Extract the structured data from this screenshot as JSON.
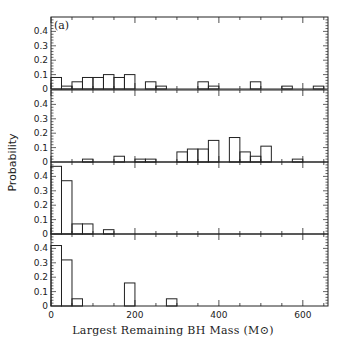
{
  "chart_data": {
    "type": "bar",
    "title": "",
    "panel_label": "(a)",
    "xlabel": "Largest Remaining BH Mass (M⊙)",
    "ylabel": "Probability",
    "xlim": [
      0,
      660
    ],
    "ylim": [
      0,
      0.5
    ],
    "x_ticks": [
      0,
      200,
      400,
      600
    ],
    "y_ticks": [
      "0",
      "0.1",
      "0.2",
      "0.3",
      "0.4"
    ],
    "bin_width": 25,
    "panels": [
      {
        "name": "panel-1",
        "bins": [
          [
            0,
            0.08
          ],
          [
            25,
            0.02
          ],
          [
            50,
            0.05
          ],
          [
            75,
            0.08
          ],
          [
            100,
            0.08
          ],
          [
            125,
            0.1
          ],
          [
            150,
            0.08
          ],
          [
            175,
            0.1
          ],
          [
            225,
            0.05
          ],
          [
            250,
            0.02
          ],
          [
            350,
            0.05
          ],
          [
            375,
            0.02
          ],
          [
            475,
            0.05
          ],
          [
            550,
            0.02
          ],
          [
            625,
            0.02
          ]
        ]
      },
      {
        "name": "panel-2",
        "bins": [
          [
            75,
            0.02
          ],
          [
            150,
            0.04
          ],
          [
            200,
            0.02
          ],
          [
            225,
            0.02
          ],
          [
            300,
            0.07
          ],
          [
            325,
            0.09
          ],
          [
            350,
            0.09
          ],
          [
            375,
            0.15
          ],
          [
            425,
            0.17
          ],
          [
            450,
            0.07
          ],
          [
            475,
            0.04
          ],
          [
            500,
            0.11
          ],
          [
            575,
            0.02
          ]
        ]
      },
      {
        "name": "panel-3",
        "bins": [
          [
            0,
            0.47
          ],
          [
            25,
            0.37
          ],
          [
            50,
            0.07
          ],
          [
            75,
            0.07
          ],
          [
            125,
            0.03
          ]
        ]
      },
      {
        "name": "panel-4",
        "bins": [
          [
            0,
            0.42
          ],
          [
            25,
            0.32
          ],
          [
            50,
            0.05
          ],
          [
            175,
            0.16
          ],
          [
            275,
            0.05
          ]
        ]
      }
    ]
  }
}
